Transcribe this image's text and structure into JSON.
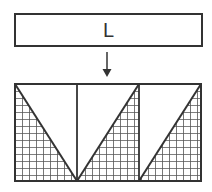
{
  "diagram": {
    "top_box": {
      "label": "L"
    },
    "arrow": {
      "direction": "down"
    },
    "bottom_panel": {
      "panels": 3,
      "hatch": "grid",
      "triangles": [
        {
          "panel": 1,
          "shaded": "lower-left",
          "diagonal": "top-left to bottom-right"
        },
        {
          "panel": 2,
          "shaded": "lower-right",
          "diagonal": "bottom-left to top-right"
        },
        {
          "panel": 3,
          "shaded": "lower-right",
          "diagonal": "bottom-left to top-right"
        }
      ]
    },
    "colors": {
      "stroke": "#333333",
      "grid": "#555555",
      "background": "#ffffff"
    }
  }
}
